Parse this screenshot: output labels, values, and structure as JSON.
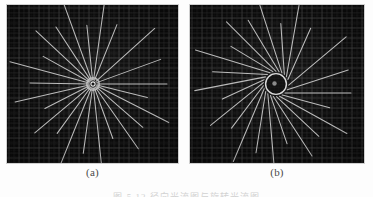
{
  "figure": {
    "background_color": "#fdfdfd",
    "panel_background_color": "#0a0a0a",
    "line_color": "#c8c8c8",
    "grid_color": "#3c3c3c",
    "caption_clipped": "图 5.12  径向光流图与旋转光流图",
    "panels": [
      {
        "id": "a",
        "sublabel": "(a)",
        "title": "radial-expansion-flow",
        "center_x": 86,
        "center_y": 79,
        "hub_radius": 5,
        "tangent_radius": 0,
        "grid_spacing": 10,
        "spoke_count": 24,
        "spokes": [
          {
            "angle_deg": 0,
            "r_inner": 4,
            "r_outer": 74
          },
          {
            "angle_deg": 14,
            "r_inner": 4,
            "r_outer": 56
          },
          {
            "angle_deg": 27,
            "r_inner": 4,
            "r_outer": 85
          },
          {
            "angle_deg": 41,
            "r_inner": 4,
            "r_outer": 66
          },
          {
            "angle_deg": 55,
            "r_inner": 4,
            "r_outer": 79
          },
          {
            "angle_deg": 70,
            "r_inner": 4,
            "r_outer": 58
          },
          {
            "angle_deg": 84,
            "r_inner": 4,
            "r_outer": 82
          },
          {
            "angle_deg": 98,
            "r_inner": 4,
            "r_outer": 70
          },
          {
            "angle_deg": 112,
            "r_inner": 4,
            "r_outer": 88
          },
          {
            "angle_deg": 126,
            "r_inner": 4,
            "r_outer": 61
          },
          {
            "angle_deg": 140,
            "r_inner": 4,
            "r_outer": 76
          },
          {
            "angle_deg": 153,
            "r_inner": 4,
            "r_outer": 54
          },
          {
            "angle_deg": 167,
            "r_inner": 4,
            "r_outer": 80
          },
          {
            "angle_deg": 181,
            "r_inner": 4,
            "r_outer": 63
          },
          {
            "angle_deg": 195,
            "r_inner": 4,
            "r_outer": 86
          },
          {
            "angle_deg": 209,
            "r_inner": 4,
            "r_outer": 57
          },
          {
            "angle_deg": 223,
            "r_inner": 4,
            "r_outer": 78
          },
          {
            "angle_deg": 237,
            "r_inner": 4,
            "r_outer": 68
          },
          {
            "angle_deg": 250,
            "r_inner": 4,
            "r_outer": 87
          },
          {
            "angle_deg": 264,
            "r_inner": 4,
            "r_outer": 59
          },
          {
            "angle_deg": 278,
            "r_inner": 4,
            "r_outer": 81
          },
          {
            "angle_deg": 292,
            "r_inner": 4,
            "r_outer": 64
          },
          {
            "angle_deg": 318,
            "r_inner": 4,
            "r_outer": 83
          },
          {
            "angle_deg": 340,
            "r_inner": 4,
            "r_outer": 72
          }
        ]
      },
      {
        "id": "b",
        "sublabel": "(b)",
        "title": "rotational-vortex-flow",
        "center_x": 86,
        "center_y": 79,
        "hub_radius": 9,
        "tangent_radius": 9,
        "grid_spacing": 10,
        "spoke_count": 24,
        "spokes": [
          {
            "angle_deg": 0,
            "r_inner": 9,
            "r_outer": 75
          },
          {
            "angle_deg": 15,
            "r_inner": 9,
            "r_outer": 58
          },
          {
            "angle_deg": 29,
            "r_inner": 9,
            "r_outer": 86
          },
          {
            "angle_deg": 43,
            "r_inner": 9,
            "r_outer": 67
          },
          {
            "angle_deg": 57,
            "r_inner": 9,
            "r_outer": 80
          },
          {
            "angle_deg": 71,
            "r_inner": 9,
            "r_outer": 60
          },
          {
            "angle_deg": 85,
            "r_inner": 9,
            "r_outer": 83
          },
          {
            "angle_deg": 99,
            "r_inner": 9,
            "r_outer": 71
          },
          {
            "angle_deg": 113,
            "r_inner": 9,
            "r_outer": 88
          },
          {
            "angle_deg": 127,
            "r_inner": 9,
            "r_outer": 62
          },
          {
            "angle_deg": 141,
            "r_inner": 9,
            "r_outer": 77
          },
          {
            "angle_deg": 155,
            "r_inner": 9,
            "r_outer": 55
          },
          {
            "angle_deg": 169,
            "r_inner": 9,
            "r_outer": 81
          },
          {
            "angle_deg": 183,
            "r_inner": 9,
            "r_outer": 64
          },
          {
            "angle_deg": 197,
            "r_inner": 9,
            "r_outer": 87
          },
          {
            "angle_deg": 211,
            "r_inner": 9,
            "r_outer": 58
          },
          {
            "angle_deg": 225,
            "r_inner": 9,
            "r_outer": 79
          },
          {
            "angle_deg": 239,
            "r_inner": 9,
            "r_outer": 69
          },
          {
            "angle_deg": 252,
            "r_inner": 9,
            "r_outer": 88
          },
          {
            "angle_deg": 266,
            "r_inner": 9,
            "r_outer": 60
          },
          {
            "angle_deg": 280,
            "r_inner": 9,
            "r_outer": 82
          },
          {
            "angle_deg": 294,
            "r_inner": 9,
            "r_outer": 65
          },
          {
            "angle_deg": 320,
            "r_inner": 9,
            "r_outer": 84
          },
          {
            "angle_deg": 342,
            "r_inner": 9,
            "r_outer": 73
          }
        ]
      }
    ]
  }
}
